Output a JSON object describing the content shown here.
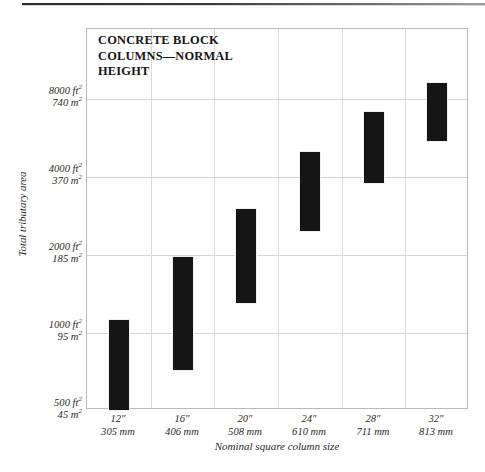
{
  "page": {
    "top_rule": "scanned-page-rule"
  },
  "chart_data": {
    "type": "bar",
    "subtype": "floating-range-bar",
    "title": "CONCRETE BLOCK\nCOLUMNS—NORMAL\nHEIGHT",
    "xlabel": "Nominal square column size",
    "ylabel": "Total tributary area",
    "yscale": "log",
    "ylim": [
      500,
      9600
    ],
    "grid": true,
    "legend": null,
    "bar_color": "#151515",
    "categories": [
      "12\"",
      "16\"",
      "20\"",
      "24\"",
      "28\"",
      "32\""
    ],
    "category_labels": [
      {
        "inches": "12\"",
        "metric": "305 mm"
      },
      {
        "inches": "16\"",
        "metric": "406 mm"
      },
      {
        "inches": "20\"",
        "metric": "508 mm"
      },
      {
        "inches": "24\"",
        "metric": "610 mm"
      },
      {
        "inches": "28\"",
        "metric": "711 mm"
      },
      {
        "inches": "32\"",
        "metric": "813 mm"
      }
    ],
    "ranges": [
      {
        "category": "12\"",
        "low": 500,
        "high": 1130
      },
      {
        "category": "16\"",
        "low": 710,
        "high": 1980
      },
      {
        "category": "20\"",
        "low": 1290,
        "high": 3030
      },
      {
        "category": "24\"",
        "low": 2450,
        "high": 5020
      },
      {
        "category": "28\"",
        "low": 3740,
        "high": 7180
      },
      {
        "category": "32\"",
        "low": 5450,
        "high": 9300
      }
    ],
    "yticks": [
      {
        "value": 8000,
        "imperial": "8000 ft",
        "imperial_exp": "2",
        "metric": "740 m",
        "metric_exp": "2"
      },
      {
        "value": 4000,
        "imperial": "4000 ft",
        "imperial_exp": "2",
        "metric": "370 m",
        "metric_exp": "2"
      },
      {
        "value": 2000,
        "imperial": "2000 ft",
        "imperial_exp": "2",
        "metric": "185 m",
        "metric_exp": "2"
      },
      {
        "value": 1000,
        "imperial": "1000 ft",
        "imperial_exp": "2",
        "metric": "95 m",
        "metric_exp": "2"
      },
      {
        "value": 500,
        "imperial": "500 ft",
        "imperial_exp": "2",
        "metric": "45 m",
        "metric_exp": "2"
      }
    ]
  }
}
